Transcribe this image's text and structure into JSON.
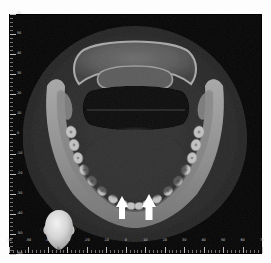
{
  "viewer": {
    "name": "cbct-axial-slice-viewer",
    "modality": "CBCT axial slice",
    "background_color": "#050505",
    "frame_color": "#ffffff"
  },
  "image": {
    "soft_tissue_color": "#2a2a2a",
    "cortical_bone_color": "#9a9a9a",
    "cancellous_bone_color": "#6a6a6a",
    "air_airway_color": "#070707",
    "tooth_enamel_color": "#cfcfcf"
  },
  "axes": {
    "units": "mm",
    "x": {
      "label": "",
      "min": -60,
      "max": 70,
      "major_step": 10,
      "minor_step": 2,
      "ticks": [
        -60,
        -50,
        -40,
        -30,
        -20,
        -10,
        0,
        10,
        20,
        30,
        40,
        50,
        60,
        70
      ]
    },
    "y": {
      "label": "",
      "min": -60,
      "max": 60,
      "major_step": 10,
      "minor_step": 2,
      "ticks": [
        60,
        50,
        40,
        30,
        20,
        10,
        0,
        -10,
        -20,
        -30,
        -40,
        -50,
        -60
      ]
    },
    "tick_color": "#c8c8c8",
    "tick_label_color": "#cfcfcf"
  },
  "orientation_widget": {
    "name": "head-orientation-indicator",
    "view": "anterior",
    "left_label": "L",
    "right_label": "R",
    "bottom_label": "A",
    "head_color": "#d8d8d8"
  },
  "annotations": {
    "arrow_color": "#ffffff",
    "arrows": [
      {
        "name": "annotation-arrow-left",
        "x": 122,
        "y": 196,
        "direction": "up"
      },
      {
        "name": "annotation-arrow-right",
        "x": 146,
        "y": 196,
        "direction": "up"
      }
    ]
  },
  "anatomy": {
    "structures": [
      "mandible",
      "mandibular dental arch",
      "cervical vertebra",
      "oropharyngeal airway",
      "soft tissue envelope"
    ]
  }
}
